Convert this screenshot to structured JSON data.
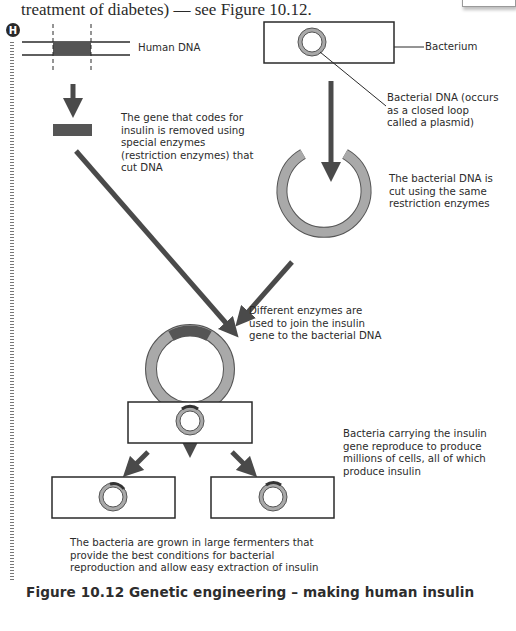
{
  "intro_text": "treatment of diabetes) — see Figure 10.12.",
  "higher_tier_badge": "H",
  "labels": {
    "human_dna": "Human DNA",
    "bacterium": "Bacterium",
    "bacterial_dna": "Bacterial DNA (occurs as a closed loop called a plasmid)",
    "gene_removed": "The gene that codes for insulin is removed using special enzymes (restriction enzymes) that cut DNA",
    "dna_cut": "The bacterial DNA is cut using the same restriction enzymes",
    "enzymes_join": "Different enzymes are used to join the insulin gene to the bacterial DNA",
    "bacteria_reproduce": "Bacteria carrying the insulin gene reproduce to produce millions of cells, all of which produce insulin",
    "fermenters": "The bacteria are grown in large fermenters that provide the best conditions for bacterial reproduction and allow easy extraction of insulin"
  },
  "caption": "Figure 10.12 Genetic engineering – making human insulin",
  "colors": {
    "dna_segment": "#555555",
    "plasmid_ring": "#a9a9a9",
    "arrow": "#4a4a4a",
    "outline": "#2a2a2a",
    "text": "#2b2b2b"
  }
}
